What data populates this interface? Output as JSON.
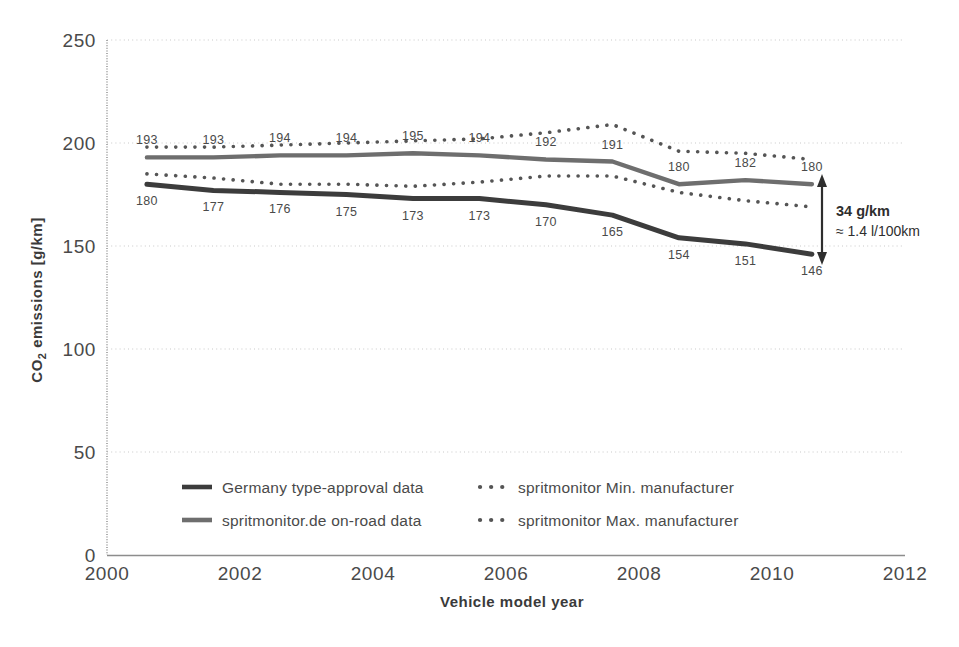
{
  "chart_data": {
    "type": "line",
    "title": "",
    "xlabel": "Vehicle model year",
    "ylabel": "CO₂ emissions [g/km]",
    "xlim": [
      2000,
      2012
    ],
    "ylim": [
      0,
      250
    ],
    "xticks": [
      "2000",
      "2002",
      "2004",
      "2006",
      "2008",
      "2010",
      "2012"
    ],
    "yticks": [
      "0",
      "50",
      "100",
      "150",
      "200",
      "250"
    ],
    "grid": "horizontal-dotted",
    "legend_position": "inside-bottom-left",
    "x": [
      2000.6,
      2001.6,
      2002.6,
      2003.6,
      2004.6,
      2005.6,
      2006.6,
      2007.6,
      2008.6,
      2009.6,
      2010.6
    ],
    "series": [
      {
        "name": "Germany type-approval data",
        "style": "solid-dark",
        "color": "#3c3c3c",
        "values": [
          180,
          177,
          176,
          175,
          173,
          173,
          170,
          165,
          154,
          151,
          146
        ],
        "labels": [
          "180",
          "177",
          "176",
          "175",
          "173",
          "173",
          "170",
          "165",
          "154",
          "151",
          "146"
        ],
        "label_position": "below"
      },
      {
        "name": "spritmonitor.de on-road data",
        "style": "solid-gray",
        "color": "#6e6e6e",
        "values": [
          193,
          193,
          194,
          194,
          195,
          194,
          192,
          191,
          180,
          182,
          180
        ],
        "labels": [
          "193",
          "193",
          "194",
          "194",
          "195",
          "194",
          "192",
          "191",
          "180",
          "182",
          "180"
        ],
        "label_position": "above"
      },
      {
        "name": "spritmonitor Min. manufacturer",
        "style": "dotted",
        "color": "#555555",
        "values": [
          185,
          183,
          180,
          180,
          179,
          181,
          184,
          184,
          176,
          172,
          169
        ],
        "labels": [],
        "label_position": "none"
      },
      {
        "name": "spritmonitor Max. manufacturer",
        "style": "dotted",
        "color": "#555555",
        "values": [
          198,
          198,
          199,
          200,
          201,
          202,
          205,
          209,
          196,
          195,
          192
        ],
        "labels": [],
        "label_position": "none"
      }
    ],
    "annotation": {
      "line1": "34 g/km",
      "line2": "≈ 1.4 l/100km",
      "arrow": "double-headed-vertical",
      "from_value": 146,
      "to_value": 180
    }
  },
  "legend": {
    "items": [
      {
        "label": "Germany type-approval data",
        "marker": "solid-line-dark"
      },
      {
        "label": "spritmonitor Min. manufacturer",
        "marker": "dotted-line"
      },
      {
        "label": "spritmonitor.de on-road data",
        "marker": "solid-line-gray"
      },
      {
        "label": "spritmonitor Max. manufacturer",
        "marker": "dotted-line"
      }
    ]
  },
  "axes": {
    "y_title_main": "CO",
    "y_title_sub": "2",
    "y_title_rest": " emissions [g/km]",
    "x_title": "Vehicle model year"
  },
  "colors": {
    "dark_line": "#3c3c3c",
    "gray_line": "#6e6e6e",
    "dotted": "#555555",
    "axis": "#9a9a9a",
    "grid": "#c9c9c9",
    "text": "#4a4a4a",
    "background": "#ffffff"
  }
}
